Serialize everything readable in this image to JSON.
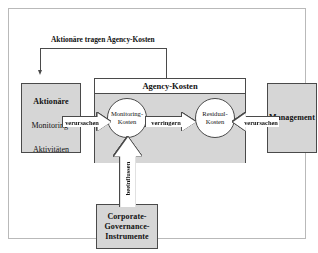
{
  "figure": {
    "title_flow": "Aktionäre tragen Agency-Kosten",
    "colors": {
      "box_fill": "#d6d6d6",
      "box_border": "#4a4a4a",
      "node_fill": "#ffffff",
      "frame_border": "#b9b9b9",
      "text": "#111111"
    }
  },
  "left_actor": {
    "title": "Aktionäre",
    "subtitle_line1": "Monitoring-",
    "subtitle_line2": "Aktivitäten"
  },
  "right_actor": {
    "title": "Management"
  },
  "bottom_actor": {
    "line1": "Corporate-",
    "line2": "Governance-",
    "line3": "Instrumente"
  },
  "agency": {
    "title": "Agency-Kosten",
    "nodes": [
      {
        "line1": "Monitoring-",
        "line2": "Kosten"
      },
      {
        "line1": "Residual-",
        "line2": "Kosten"
      }
    ]
  },
  "arrows": {
    "left_cause": "verursachen",
    "reduce": "verringern",
    "right_cause": "verursachen",
    "influence": "beeinflussen"
  }
}
